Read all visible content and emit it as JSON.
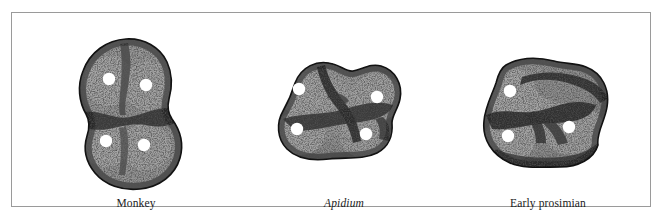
{
  "figure": {
    "kind": "comparative-anatomy-plate",
    "frame_color": "#9a9a9a",
    "background_color": "#ffffff",
    "specimens": [
      {
        "id": "monkey",
        "label": "Monkey",
        "label_style": "roman",
        "cusp_count": 4,
        "cusp_marker_color": "#ffffff",
        "enamel_fill": "#8e8e8e",
        "outline_color": "#1a1a1a",
        "cusps": [
          {
            "name": "cusp-anterolingual",
            "cx": 41,
            "cy": 44
          },
          {
            "name": "cusp-anterobuccal",
            "cx": 78,
            "cy": 50
          },
          {
            "name": "cusp-posterolingual",
            "cx": 38,
            "cy": 106
          },
          {
            "name": "cusp-posterobuccal",
            "cx": 76,
            "cy": 110
          }
        ]
      },
      {
        "id": "apidium",
        "label": "Apidium",
        "label_style": "italic",
        "cusp_count": 4,
        "cusp_marker_color": "#ffffff",
        "enamel_fill": "#8e8e8e",
        "outline_color": "#1a1a1a",
        "cusps": [
          {
            "name": "cusp-anterolingual",
            "cx": 32,
            "cy": 54
          },
          {
            "name": "cusp-anterobuccal",
            "cx": 110,
            "cy": 62
          },
          {
            "name": "cusp-posterolingual",
            "cx": 30,
            "cy": 94
          },
          {
            "name": "cusp-posterobuccal",
            "cx": 99,
            "cy": 99
          }
        ]
      },
      {
        "id": "early-prosimian",
        "label": "Early prosimian",
        "label_style": "roman",
        "cusp_count": 3,
        "cusp_marker_color": "#ffffff",
        "enamel_fill": "#8e8e8e",
        "outline_color": "#1a1a1a",
        "cusps": [
          {
            "name": "cusp-anterolingual",
            "cx": 48,
            "cy": 56
          },
          {
            "name": "cusp-posterolingual",
            "cx": 46,
            "cy": 101
          },
          {
            "name": "cusp-buccal",
            "cx": 107,
            "cy": 92
          }
        ]
      }
    ]
  }
}
